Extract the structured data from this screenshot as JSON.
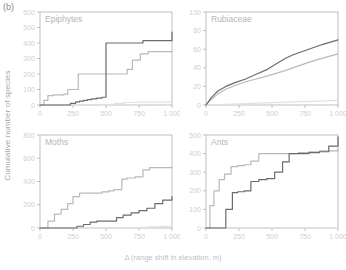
{
  "figure": {
    "panel_letter": "(b)",
    "ylabel": "Cumulative number of species",
    "xlabel": "Δ (range shift in elevation, m)",
    "colors": {
      "series_dark": "#6b6b6b",
      "series_mid": "#b9b9b9",
      "series_light": "#e2e2e2",
      "axis": "#b0b0b0",
      "tick_text": "#cfcfcf",
      "title_text": "#b6b6b6"
    }
  },
  "chart_data": [
    {
      "type": "line",
      "title": "Epiphytes",
      "position": "top-left",
      "xlabel": "Δ (range shift in elevation, m)",
      "ylabel": "Cumulative number of species",
      "xlim": [
        0,
        1000
      ],
      "ylim": [
        0,
        600
      ],
      "xticks": [
        0,
        250,
        500,
        750,
        1000
      ],
      "xticklabels": [
        "0",
        "250",
        "500",
        "750",
        "1 000"
      ],
      "yticks": [
        0,
        100,
        200,
        300,
        400,
        500,
        600
      ],
      "yticklabels": [
        "0",
        "100",
        "200",
        "300",
        "400",
        "500",
        "600"
      ],
      "grid": false,
      "legend": "none",
      "series": [
        {
          "name": "series-dark",
          "color": "#6b6b6b",
          "step": true,
          "x": [
            0,
            180,
            230,
            270,
            300,
            330,
            360,
            390,
            430,
            470,
            500,
            540,
            700,
            780,
            1000
          ],
          "y": [
            0,
            0,
            10,
            20,
            25,
            30,
            35,
            40,
            45,
            50,
            400,
            400,
            400,
            415,
            470
          ]
        },
        {
          "name": "series-mid",
          "color": "#b9b9b9",
          "step": true,
          "x": [
            0,
            30,
            60,
            100,
            150,
            180,
            210,
            250,
            290,
            330,
            430,
            620,
            660,
            700,
            760,
            820,
            1000
          ],
          "y": [
            0,
            30,
            60,
            65,
            65,
            70,
            100,
            100,
            200,
            200,
            200,
            200,
            230,
            290,
            330,
            345,
            345
          ]
        },
        {
          "name": "series-light",
          "color": "#e2e2e2",
          "step": true,
          "x": [
            0,
            400,
            470,
            560,
            640,
            720,
            1000
          ],
          "y": [
            0,
            0,
            2,
            10,
            16,
            18,
            20
          ]
        }
      ]
    },
    {
      "type": "line",
      "title": "Rubiaceae",
      "position": "top-right",
      "xlabel": "Δ (range shift in elevation, m)",
      "ylabel": "Cumulative number of species",
      "xlim": [
        0,
        1000
      ],
      "ylim": [
        0,
        100
      ],
      "xticks": [
        0,
        250,
        500,
        750,
        1000
      ],
      "xticklabels": [
        "0",
        "250",
        "500",
        "750",
        "1 000"
      ],
      "yticks": [
        0,
        20,
        40,
        60,
        80,
        100
      ],
      "yticklabels": [
        "0",
        "20",
        "40",
        "60",
        "80",
        "100"
      ],
      "grid": false,
      "legend": "none",
      "series": [
        {
          "name": "series-dark",
          "color": "#6b6b6b",
          "step": false,
          "x": [
            0,
            40,
            90,
            150,
            220,
            300,
            380,
            460,
            530,
            600,
            660,
            720,
            800,
            880,
            1000
          ],
          "y": [
            0,
            8,
            15,
            20,
            24,
            28,
            33,
            38,
            44,
            50,
            54,
            57,
            61,
            65,
            70
          ]
        },
        {
          "name": "series-mid",
          "color": "#b9b9b9",
          "step": false,
          "x": [
            0,
            40,
            90,
            150,
            220,
            300,
            380,
            460,
            530,
            600,
            680,
            760,
            850,
            1000
          ],
          "y": [
            0,
            6,
            12,
            17,
            21,
            25,
            28,
            31,
            34,
            37,
            41,
            45,
            49,
            55
          ]
        },
        {
          "name": "series-light",
          "color": "#e2e2e2",
          "step": false,
          "x": [
            0,
            200,
            400,
            600,
            800,
            1000
          ],
          "y": [
            0,
            1,
            2,
            3,
            4,
            5
          ]
        }
      ]
    },
    {
      "type": "line",
      "title": "Moths",
      "position": "bottom-left",
      "xlabel": "Δ (range shift in elevation, m)",
      "ylabel": "Cumulative number of species",
      "xlim": [
        0,
        1000
      ],
      "ylim": [
        0,
        800
      ],
      "xticks": [
        0,
        250,
        500,
        750,
        1000
      ],
      "xticklabels": [
        "0",
        "250",
        "500",
        "750",
        "1 000"
      ],
      "yticks": [
        0,
        200,
        400,
        600,
        800
      ],
      "yticklabels": [
        "0",
        "200",
        "400",
        "600",
        "800"
      ],
      "grid": false,
      "legend": "none",
      "series": [
        {
          "name": "series-mid",
          "color": "#b9b9b9",
          "step": true,
          "x": [
            0,
            60,
            110,
            160,
            210,
            250,
            300,
            420,
            470,
            520,
            560,
            620,
            660,
            720,
            780,
            830,
            1000
          ],
          "y": [
            0,
            60,
            120,
            160,
            210,
            270,
            300,
            300,
            310,
            320,
            330,
            420,
            430,
            440,
            500,
            520,
            520
          ]
        },
        {
          "name": "series-dark",
          "color": "#6b6b6b",
          "step": true,
          "x": [
            0,
            230,
            280,
            330,
            380,
            430,
            480,
            530,
            580,
            630,
            690,
            750,
            810,
            870,
            930,
            1000
          ],
          "y": [
            0,
            0,
            15,
            30,
            50,
            60,
            60,
            60,
            90,
            110,
            130,
            150,
            170,
            210,
            240,
            270
          ]
        },
        {
          "name": "series-light",
          "color": "#e2e2e2",
          "step": true,
          "x": [
            0,
            700,
            760,
            820,
            900,
            1000
          ],
          "y": [
            0,
            0,
            6,
            10,
            14,
            18
          ]
        }
      ]
    },
    {
      "type": "line",
      "title": "Ants",
      "position": "bottom-right",
      "xlabel": "Δ (range shift in elevation, m)",
      "ylabel": "Cumulative number of species",
      "xlim": [
        0,
        1000
      ],
      "ylim": [
        0,
        500
      ],
      "xticks": [
        0,
        250,
        500,
        750,
        1000
      ],
      "xticklabels": [
        "0",
        "250",
        "500",
        "750",
        "1 000"
      ],
      "yticks": [
        0,
        100,
        200,
        300,
        400,
        500
      ],
      "yticklabels": [
        "0",
        "100",
        "200",
        "300",
        "400",
        "500"
      ],
      "grid": false,
      "legend": "none",
      "series": [
        {
          "name": "series-mid",
          "color": "#b9b9b9",
          "step": true,
          "x": [
            0,
            30,
            60,
            100,
            140,
            190,
            240,
            290,
            340,
            400,
            620,
            700,
            780,
            860,
            1000
          ],
          "y": [
            0,
            120,
            200,
            260,
            290,
            330,
            335,
            340,
            360,
            400,
            400,
            405,
            410,
            415,
            425
          ]
        },
        {
          "name": "series-dark",
          "color": "#6b6b6b",
          "step": true,
          "x": [
            0,
            110,
            150,
            200,
            240,
            290,
            340,
            400,
            460,
            520,
            580,
            630,
            700,
            780,
            860,
            930,
            1000
          ],
          "y": [
            0,
            0,
            100,
            190,
            195,
            200,
            250,
            260,
            265,
            300,
            355,
            400,
            400,
            405,
            410,
            440,
            490
          ]
        },
        {
          "name": "series-light",
          "color": "#e2e2e2",
          "step": true,
          "x": [
            0,
            500,
            700,
            900,
            1000
          ],
          "y": [
            0,
            0,
            1,
            2,
            3
          ]
        }
      ]
    }
  ]
}
